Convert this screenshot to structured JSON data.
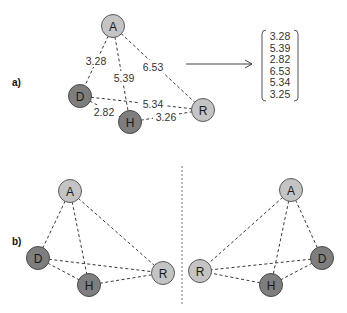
{
  "panels": {
    "a": {
      "label": "a)",
      "nodes": {
        "A": {
          "label": "A",
          "shade": "light"
        },
        "D": {
          "label": "D",
          "shade": "dark"
        },
        "H": {
          "label": "H",
          "shade": "dark"
        },
        "R": {
          "label": "R",
          "shade": "light"
        }
      },
      "edges": [
        {
          "from": "A",
          "to": "D",
          "weight": "3.28"
        },
        {
          "from": "A",
          "to": "H",
          "weight": "5.39"
        },
        {
          "from": "A",
          "to": "R",
          "weight": "6.53"
        },
        {
          "from": "D",
          "to": "R",
          "weight": "5.34"
        },
        {
          "from": "D",
          "to": "H",
          "weight": "2.82"
        },
        {
          "from": "H",
          "to": "R",
          "weight": "3.26"
        }
      ],
      "vector": [
        "3.28",
        "5.39",
        "2.82",
        "6.53",
        "5.34",
        "3.25"
      ]
    },
    "b": {
      "label": "b)",
      "left_nodes": {
        "A": "A",
        "D": "D",
        "H": "H",
        "R": "R"
      },
      "right_nodes": {
        "A": "A",
        "R": "R",
        "H": "H",
        "D": "D"
      }
    }
  },
  "colors": {
    "light_node": "#c4c4c4",
    "dark_node": "#7e7e7e",
    "edge": "#3a3a3a"
  }
}
